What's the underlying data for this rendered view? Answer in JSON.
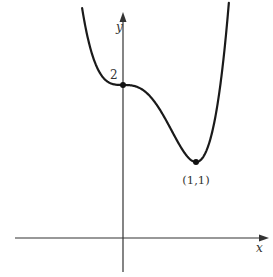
{
  "figure": {
    "function": "f(x) = 3x^4 - 4x^3 + 2",
    "x_axis_label": "x",
    "y_axis_label": "y",
    "y_intercept_label": "2",
    "minimum_label": "(1,1)",
    "points": [
      {
        "x": 0,
        "y": 2,
        "label": "2"
      },
      {
        "x": 1,
        "y": 1,
        "label": "(1,1)"
      }
    ],
    "colors": {
      "curve": "#1a1a1a",
      "axes": "#333333",
      "text": "#333333"
    }
  }
}
